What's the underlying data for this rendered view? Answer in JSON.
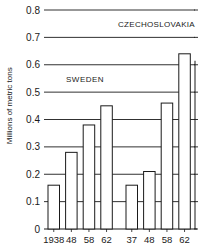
{
  "chart_data": {
    "type": "bar",
    "title": "",
    "xlabel": "",
    "ylabel": "Millions of metric tons",
    "ylim": [
      0,
      0.8
    ],
    "yticks": [
      0,
      0.1,
      0.2,
      0.3,
      0.4,
      0.5,
      0.6,
      0.7,
      0.8
    ],
    "ytick_labels": [
      "0",
      "0.1",
      "0.2",
      "0.3",
      "0.4",
      "0.5",
      "0.6",
      "0.7",
      "0.8"
    ],
    "grid": true,
    "groups": [
      {
        "name": "SWEDEN",
        "categories": [
          "1938",
          "48",
          "58",
          "62"
        ],
        "values": [
          0.16,
          0.28,
          0.38,
          0.45
        ]
      },
      {
        "name": "CZECHOSLOVAKIA",
        "categories": [
          "37",
          "48",
          "58",
          "62"
        ],
        "values": [
          0.16,
          0.21,
          0.46,
          0.64
        ]
      }
    ],
    "annotations": [
      "SWEDEN",
      "CZECHOSLOVAKIA"
    ],
    "colors": {
      "bar_fill": "#ffffff",
      "bar_stroke": "#1a1a1a",
      "grid": "#1a1a1a"
    }
  }
}
